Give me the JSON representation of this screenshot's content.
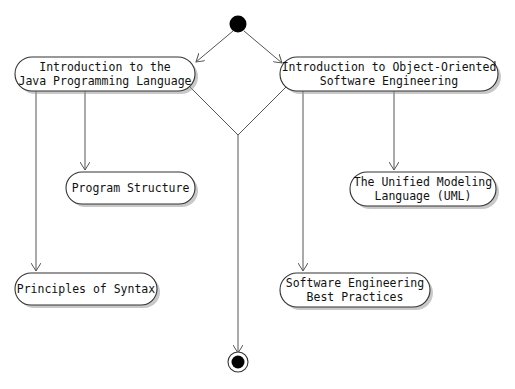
{
  "diagram": {
    "type": "activity",
    "colors": {
      "stroke": "#333333",
      "edge": "#555555",
      "fill": "#ffffff",
      "node_solid": "#000000"
    },
    "start_node": {
      "label": "start"
    },
    "end_node": {
      "label": "end"
    },
    "activities": {
      "java_intro": {
        "line1": "Introduction to the",
        "line2": "Java Programming Language"
      },
      "oose_intro": {
        "line1": "Introduction to Object-Oriented",
        "line2": "Software Engineering"
      },
      "program_structure": {
        "line1": "Program Structure"
      },
      "principles_syntax": {
        "line1": "Principles of Syntax"
      },
      "uml": {
        "line1": "The Unified Modeling",
        "line2": "Language (UML)"
      },
      "se_best_practices": {
        "line1": "Software Engineering",
        "line2": "Best Practices"
      }
    },
    "edges": [
      {
        "from": "start",
        "to": "java_intro"
      },
      {
        "from": "start",
        "to": "oose_intro"
      },
      {
        "from": "java_intro",
        "to": "program_structure"
      },
      {
        "from": "java_intro",
        "to": "principles_syntax"
      },
      {
        "from": "oose_intro",
        "to": "uml"
      },
      {
        "from": "oose_intro",
        "to": "se_best_practices"
      },
      {
        "from": "java_intro",
        "to": "merge"
      },
      {
        "from": "oose_intro",
        "to": "merge"
      },
      {
        "from": "merge",
        "to": "end"
      }
    ]
  }
}
